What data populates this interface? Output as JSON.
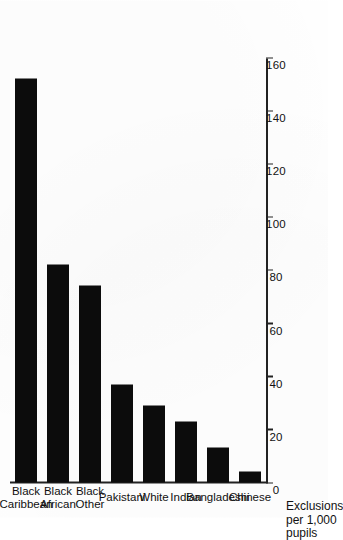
{
  "chart_data": {
    "type": "bar",
    "orientation": "horizontal",
    "title": "",
    "subtitle": "",
    "xlabel": "",
    "ylabel": "Exclusions per 1,000 pupils",
    "ylabel_lines": [
      "Exclusions",
      "per 1,000",
      "pupils"
    ],
    "categories": [
      "Black Caribbean",
      "Black African",
      "Black Other",
      "Pakistani",
      "White",
      "Indian",
      "Bangladeshi",
      "Chinese"
    ],
    "category_lines": [
      [
        "Black",
        "Caribbean"
      ],
      [
        "Black",
        "African"
      ],
      [
        "Black",
        "Other"
      ],
      [
        "Pakistani"
      ],
      [
        "White"
      ],
      [
        "Indian"
      ],
      [
        "Bangladeshi"
      ],
      [
        "Chinese"
      ]
    ],
    "values": [
      152,
      82,
      74,
      37,
      29,
      23,
      13,
      4
    ],
    "ylim": [
      0,
      160
    ],
    "tick_labels": [
      "0",
      "20",
      "40",
      "60",
      "80",
      "100",
      "120",
      "140",
      "160"
    ],
    "tick_values": [
      0,
      20,
      40,
      60,
      80,
      100,
      120,
      140,
      160
    ],
    "grid": false,
    "legend": false,
    "legend_position": "none",
    "bar_color": "#0c0c0c",
    "axis_color": "#222222",
    "background_color": "#ffffff",
    "page_rotation_degrees": -90
  }
}
